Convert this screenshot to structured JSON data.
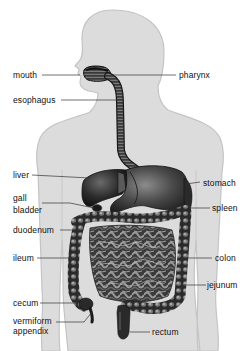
{
  "diagram": {
    "colors": {
      "body_fill": "#dcdcdc",
      "body_outline": "#c4c4c4",
      "organ_dark": "#1e1e1e",
      "organ_mid": "#555555",
      "organ_light": "#9a9a9a",
      "leader_line": "#333333",
      "text": "#111111"
    },
    "labels_left": [
      {
        "id": "mouth",
        "text": "mouth"
      },
      {
        "id": "esophagus",
        "text": "esophagus"
      },
      {
        "id": "liver",
        "text": "liver"
      },
      {
        "id": "gall-bladder",
        "text_line1": "gall",
        "text_line2": "bladder"
      },
      {
        "id": "duodenum",
        "text": "duodenum"
      },
      {
        "id": "ileum",
        "text": "ileum"
      },
      {
        "id": "cecum",
        "text": "cecum"
      },
      {
        "id": "vermiform-appendix",
        "text_line1": "vermiform",
        "text_line2": "appendix"
      }
    ],
    "labels_right": [
      {
        "id": "pharynx",
        "text": "pharynx"
      },
      {
        "id": "stomach",
        "text": "stomach"
      },
      {
        "id": "spleen",
        "text": "spleen"
      },
      {
        "id": "colon",
        "text": "colon"
      },
      {
        "id": "jejunum",
        "text": "jejunum"
      },
      {
        "id": "rectum",
        "text": "rectum"
      }
    ]
  }
}
